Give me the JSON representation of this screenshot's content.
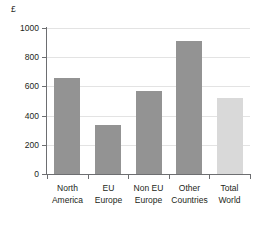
{
  "chart_data": {
    "type": "bar",
    "title": "",
    "subtitle": "",
    "unit_label": "£",
    "xlabel": "",
    "ylabel": "",
    "ylim": [
      0,
      1000
    ],
    "ytick_values": [
      0,
      200,
      400,
      600,
      800,
      1000
    ],
    "ytick_labels": [
      "0",
      "200",
      "400",
      "600",
      "800",
      "1000"
    ],
    "grid": "horizontal",
    "legend": "none",
    "categories": [
      "North America",
      "EU Europe",
      "Non EU Europe",
      "Other Countries",
      "Total World"
    ],
    "category_lines": [
      [
        "North",
        "America"
      ],
      [
        "EU",
        "Europe"
      ],
      [
        "Non EU",
        "Europe"
      ],
      [
        "Other",
        "Countries"
      ],
      [
        "Total",
        "World"
      ]
    ],
    "values": [
      660,
      333,
      570,
      910,
      520
    ],
    "bar_colors": [
      "#939393",
      "#939393",
      "#939393",
      "#939393",
      "#d9d9d9"
    ],
    "colors": {
      "bar_dark": "#939393",
      "bar_light": "#d9d9d9",
      "gridline": "#e3e3e3",
      "axis": "#6d6e71",
      "text": "#231f20",
      "background": "#ffffff"
    }
  }
}
